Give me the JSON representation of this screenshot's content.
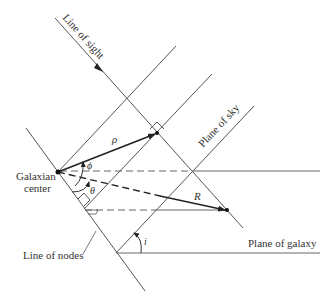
{
  "diagram": {
    "labels": {
      "line_of_sight": "Line of sight",
      "plane_of_sky": "Plane of sky",
      "galaxian_center_line1": "Galaxian",
      "galaxian_center_line2": "center",
      "line_of_nodes": "Line of nodes",
      "plane_of_galaxy": "Plane of galaxy",
      "rho": "ρ",
      "phi": "ϕ",
      "theta": "θ",
      "R": "R",
      "i": "i"
    },
    "colors": {
      "line": "#555555",
      "vector": "#222222",
      "text": "#333333"
    }
  }
}
